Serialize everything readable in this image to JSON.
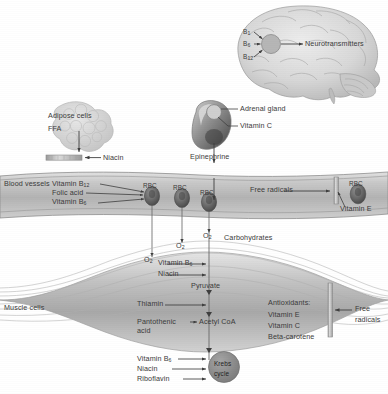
{
  "figure": {
    "type": "biological-pathway-diagram",
    "palette": {
      "background": "#ffffff",
      "tissue_light": "#d9d9d9",
      "tissue_mid": "#bdbdbd",
      "tissue_dark": "#8f8f8f",
      "vessel": "#c4c4c4",
      "rbc": "#6e6e6e",
      "krebs": "#8a8a8a",
      "text": "#3a3a3a",
      "arrow": "#4a4a4a",
      "membrane": "#b5b5b5"
    }
  },
  "brain": {
    "region_name": "brain",
    "neurotransmitter_node": "neurotransmitter-synthesis-site",
    "inputs": [
      {
        "label": "B",
        "subscript": "1"
      },
      {
        "label": "B",
        "subscript": "6"
      },
      {
        "label": "B",
        "subscript": "12"
      }
    ],
    "output_label": "Neurotransmitters"
  },
  "adipose": {
    "tissue_label": "Adipose cells",
    "product_label": "FFA",
    "cofactor_label": "Niacin",
    "membrane_name": "adipose-membrane-bar"
  },
  "adrenal": {
    "organ_name": "kidney-with-adrenal-gland",
    "gland_label": "Adrenal gland",
    "cofactor_label": "Vitamin C",
    "hormone_label": "Epinephrine"
  },
  "blood_vessel": {
    "region_label": "Blood vessels",
    "left_inputs": [
      {
        "text": "Vitamin B",
        "subscript": "12"
      },
      {
        "text": "Folic acid",
        "subscript": ""
      },
      {
        "text": "Vitamin B",
        "subscript": "6"
      }
    ],
    "cells": [
      {
        "label": "RBC"
      },
      {
        "label": "RBC"
      },
      {
        "label": "RBC"
      },
      {
        "label": "RBC"
      }
    ],
    "free_radicals_label": "Free radicals",
    "protectant_label": "Vitamin E",
    "membrane_name": "rbc-membrane-bar"
  },
  "diffusion": {
    "oxygen_labels": [
      {
        "text": "O",
        "subscript": "2"
      },
      {
        "text": "O",
        "subscript": "2"
      },
      {
        "text": "O",
        "subscript": "2"
      }
    ],
    "substrate_label": "Carbohydrates"
  },
  "muscle": {
    "region_label": "Muscle cells",
    "glycolysis_cofactors": [
      {
        "text": "Vitamin B",
        "subscript": "6"
      },
      {
        "text": "Niacin",
        "subscript": ""
      }
    ],
    "intermediate_1": "Pyruvate",
    "pyruvate_cofactor": "Thiamin",
    "acetyl_cofactor_line1": "Pantothenic",
    "acetyl_cofactor_line2": "acid",
    "intermediate_2": "Acetyl CoA",
    "krebs_label_line1": "Krebs",
    "krebs_label_line2": "cycle",
    "krebs_cofactors": [
      {
        "text": "Vitamin B",
        "subscript": "6"
      },
      {
        "text": "Niacin",
        "subscript": ""
      },
      {
        "text": "Riboflavin",
        "subscript": ""
      }
    ],
    "antioxidants": {
      "heading": "Antioxidants:",
      "items": [
        "Vitamin E",
        "Vitamin C",
        "Beta-carotene"
      ]
    },
    "free_radicals_label_line1": "Free",
    "free_radicals_label_line2": "radicals",
    "membrane_name": "muscle-membrane-bar"
  }
}
